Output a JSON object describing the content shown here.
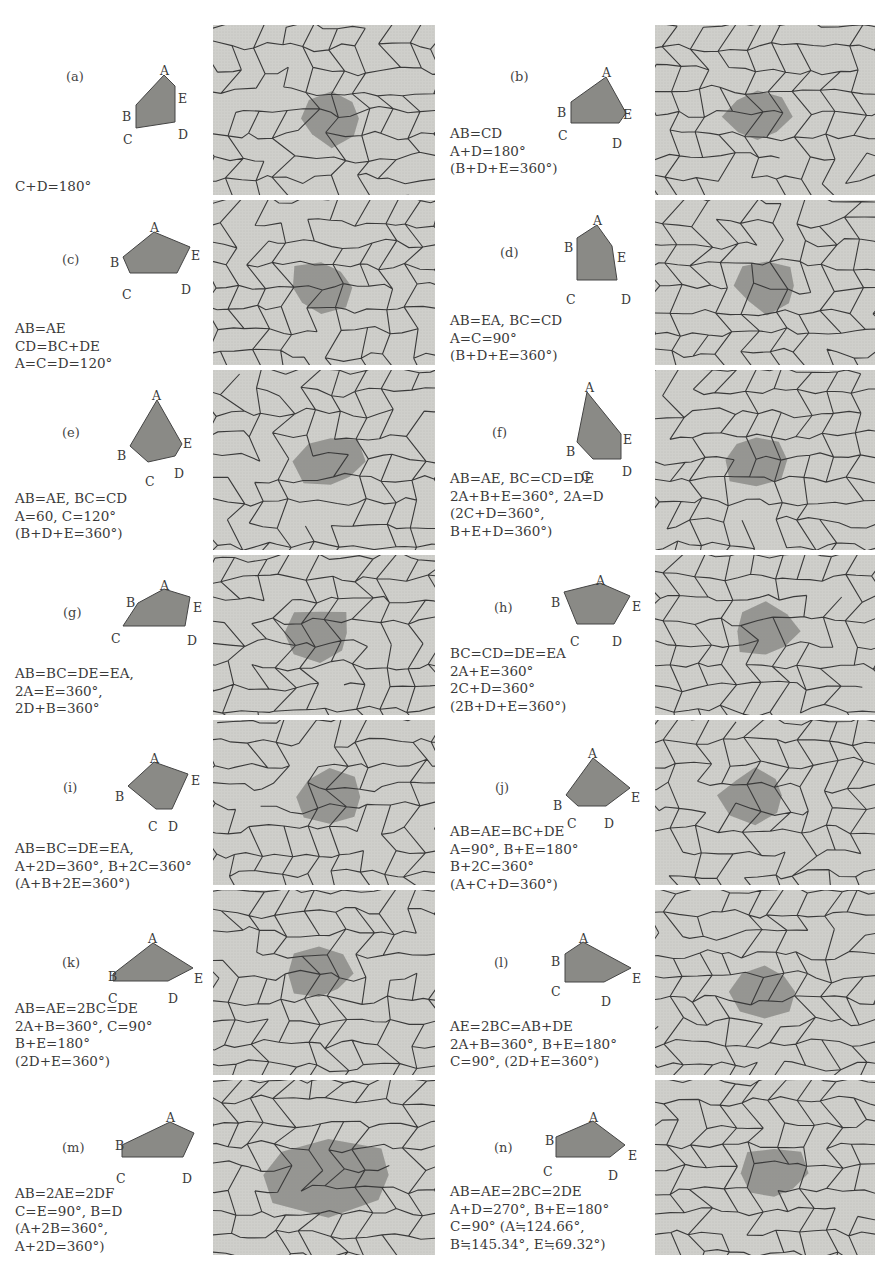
{
  "figure": {
    "panels": [
      {
        "id": "a",
        "label": "(a)",
        "conditions": [
          "C+D=180°"
        ]
      },
      {
        "id": "b",
        "label": "(b)",
        "conditions": [
          "AB=CD",
          "A+D=180°",
          "(B+D+E=360°)"
        ]
      },
      {
        "id": "c",
        "label": "(c)",
        "conditions": [
          "AB=AE",
          "CD=BC+DE",
          "A=C=D=120°"
        ]
      },
      {
        "id": "d",
        "label": "(d)",
        "conditions": [
          "AB=EA, BC=CD",
          "A=C=90°",
          "(B+D+E=360°)"
        ]
      },
      {
        "id": "e",
        "label": "(e)",
        "conditions": [
          "AB=AE, BC=CD",
          "A=60, C=120°",
          "(B+D+E=360°)"
        ]
      },
      {
        "id": "f",
        "label": "(f)",
        "conditions": [
          "AB=AE, BC=CD=DE",
          "2A+B+E=360°, 2A=D",
          "(2C+D=360°,",
          "B+E+D=360°)"
        ]
      },
      {
        "id": "g",
        "label": "(g)",
        "conditions": [
          "AB=BC=DE=EA,",
          "2A=E=360°,",
          "2D+B=360°"
        ]
      },
      {
        "id": "h",
        "label": "(h)",
        "conditions": [
          "BC=CD=DE=EA",
          "2A+E=360°",
          "2C+D=360°",
          "(2B+D+E=360°)"
        ]
      },
      {
        "id": "i",
        "label": "(i)",
        "conditions": [
          "AB=BC=DE=EA,",
          "A+2D=360°, B+2C=360°",
          "(A+B+2E=360°)"
        ]
      },
      {
        "id": "j",
        "label": "(j)",
        "conditions": [
          "AB=AE=BC+DE",
          "A=90°, B+E=180°",
          "B+2C=360°",
          "(A+C+D=360°)"
        ]
      },
      {
        "id": "k",
        "label": "(k)",
        "conditions": [
          "AB=AE=2BC=DE",
          "2A+B=360°, C=90°",
          "B+E=180°",
          "(2D+E=360°)"
        ]
      },
      {
        "id": "l",
        "label": "(l)",
        "conditions": [
          "AE=2BC=AB+DE",
          "2A+B=360°, B+E=180°",
          "C=90°, (2D+E=360°)"
        ]
      },
      {
        "id": "m",
        "label": "(m)",
        "conditions": [
          "AB=2AE=2DF",
          "C=E=90°, B=D",
          "(A+2B=360°,",
          "A+2D=360°)"
        ]
      },
      {
        "id": "n",
        "label": "(n)",
        "conditions": [
          "AB=AE=2BC=2DE",
          "A+D=270°, B+E=180°",
          "C=90° (A≒124.66°,",
          "B≒145.34°, E≒69.32°)"
        ]
      }
    ],
    "vertex_labels": {
      "A": "A",
      "B": "B",
      "C": "C",
      "D": "D",
      "E": "E"
    },
    "colors": {
      "tile_fill": "#cfcfcb",
      "tile_edge": "#3a3a3a",
      "highlight": "#8c8c88",
      "pentagon_fill": "#8a8a86"
    }
  }
}
